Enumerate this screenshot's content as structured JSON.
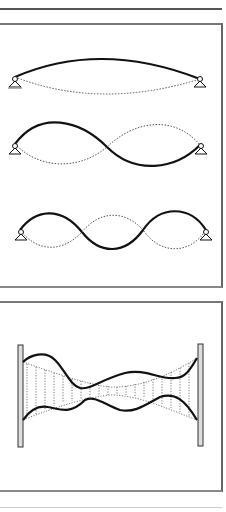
{
  "figure": {
    "panels": [
      {
        "id": "standing-wave-modes",
        "title": "",
        "modes": [
          {
            "name": "mode-1",
            "half_waves": 1
          },
          {
            "name": "mode-2",
            "half_waves": 2
          },
          {
            "name": "mode-3",
            "half_waves": 3
          }
        ],
        "supports": "pin supports at both ends"
      },
      {
        "id": "string-between-walls",
        "title": "",
        "description": "irregular vibration envelope between fixed walls"
      }
    ],
    "colors": {
      "line": "#111111",
      "dotted": "#555555",
      "frame": "#666666",
      "wall_fill": "#dddddd"
    }
  }
}
